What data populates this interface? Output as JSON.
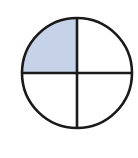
{
  "figure": {
    "name": "fraction-circle-diagram",
    "canvas": {
      "width": 138,
      "height": 158,
      "background_color": "#ffffff"
    },
    "circle": {
      "center_x": 77,
      "center_y": 73,
      "radius": 55,
      "stroke_color": "#1a1a1a",
      "stroke_width": 2.6,
      "fill_color": "#ffffff"
    },
    "dividers": [
      {
        "name": "vertical-diameter",
        "orientation": "vertical",
        "stroke_color": "#1a1a1a",
        "stroke_width": 2.6
      },
      {
        "name": "horizontal-diameter",
        "orientation": "horizontal",
        "stroke_color": "#1a1a1a",
        "stroke_width": 2.6
      }
    ],
    "quadrants": [
      {
        "name": "upper-left",
        "shaded": true,
        "fill_color": "#c5d2e8",
        "start_angle_deg": 180,
        "end_angle_deg": 270
      },
      {
        "name": "upper-right",
        "shaded": false,
        "fill_color": "#ffffff",
        "start_angle_deg": 270,
        "end_angle_deg": 360
      },
      {
        "name": "lower-right",
        "shaded": false,
        "fill_color": "#ffffff",
        "start_angle_deg": 0,
        "end_angle_deg": 90
      },
      {
        "name": "lower-left",
        "shaded": false,
        "fill_color": "#ffffff",
        "start_angle_deg": 90,
        "end_angle_deg": 180
      }
    ]
  },
  "chart_data": {
    "type": "pie",
    "title": "",
    "xlabel": "",
    "ylabel": "",
    "categories": [
      "upper-left",
      "upper-right",
      "lower-right",
      "lower-left"
    ],
    "values": [
      25,
      25,
      25,
      25
    ],
    "shaded_fraction": "1/4",
    "shaded_count": 1,
    "total_parts": 4,
    "colors": [
      "#c5d2e8",
      "#ffffff",
      "#ffffff",
      "#ffffff"
    ],
    "legend": "none",
    "grid": false
  }
}
